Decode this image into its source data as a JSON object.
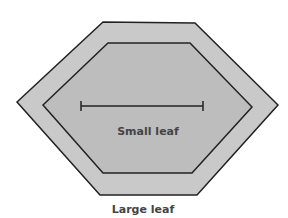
{
  "diagram": {
    "labels": {
      "small_leaf": "Small leaf",
      "large_leaf": "Large leaf"
    },
    "colors": {
      "outer_fill": "#c9c9c9",
      "inner_fill": "#bdbdbd",
      "stroke": "#222222",
      "text": "#444444"
    }
  }
}
